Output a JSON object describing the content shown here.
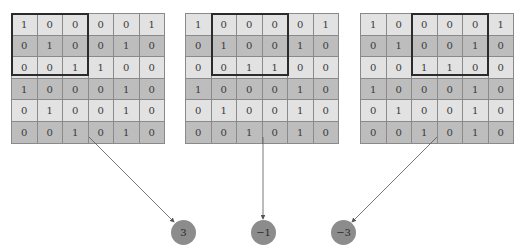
{
  "matrix": [
    [
      "1",
      "0",
      "0",
      "0",
      "0",
      "1"
    ],
    [
      "0",
      "1",
      "0",
      "0",
      "1",
      "0"
    ],
    [
      "0",
      "0",
      "1",
      "1",
      "0",
      "0"
    ],
    [
      "1",
      "0",
      "0",
      "0",
      "1",
      "0"
    ],
    [
      "0",
      "1",
      "0",
      "0",
      "1",
      "0"
    ],
    [
      "0",
      "0",
      "1",
      "0",
      "1",
      "0"
    ]
  ],
  "panels": [
    {
      "grid_left": 11,
      "window_col_start": 0,
      "window_cols": 3,
      "window_rows": 3,
      "result": "3",
      "node_center_x": 183
    },
    {
      "grid_left": 185,
      "window_col_start": 1,
      "window_cols": 3,
      "window_rows": 3,
      "result": "−1",
      "node_center_x": 263
    },
    {
      "grid_left": 360,
      "window_col_start": 2,
      "window_cols": 3,
      "window_rows": 3,
      "result": "−3",
      "node_center_x": 343
    }
  ],
  "colors": {
    "row_light": "#e2e2e2",
    "row_dark": "#bdbdbd",
    "node_fill": "#8c8c8c",
    "window_border": "#2b2b2b",
    "arrow": "#555555"
  }
}
